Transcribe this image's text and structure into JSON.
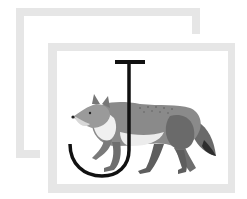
{
  "illustration": {
    "letter": "J",
    "subject": "jackal",
    "frame_color": "#e6e6e6",
    "letter_color": "#111111",
    "animal_colors": {
      "body": "#8a8a8a",
      "body_dark": "#5a5a5a",
      "belly": "#ececec",
      "tail_tip": "#2e2e2e"
    }
  }
}
